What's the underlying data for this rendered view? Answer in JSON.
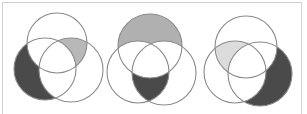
{
  "figure": {
    "colors": {
      "dark": "#4a4a4a",
      "medium": "#b4b4b4",
      "light": "#dcdcdc",
      "outline": "#8a8a8a",
      "frame": "#cfcfcf"
    },
    "diagrams": [
      {
        "id": "venn-1",
        "circles": {
          "top": {
            "cx": 57,
            "cy": 43,
            "r": 30
          },
          "left": {
            "cx": 45,
            "cy": 69,
            "r": 31
          },
          "right": {
            "cx": 71,
            "cy": 70,
            "r": 32
          }
        },
        "shaded": [
          {
            "region": "left only",
            "shade": "dark"
          },
          {
            "region": "top and right, not left",
            "shade": "medium"
          }
        ]
      },
      {
        "id": "venn-2",
        "circles": {
          "top": {
            "cx": 150,
            "cy": 46,
            "r": 32
          },
          "left": {
            "cx": 138,
            "cy": 72,
            "r": 31
          },
          "right": {
            "cx": 164,
            "cy": 73,
            "r": 32
          }
        },
        "shaded": [
          {
            "region": "top only",
            "shade": "medium"
          },
          {
            "region": "left and right, not top",
            "shade": "dark"
          }
        ]
      },
      {
        "id": "venn-3",
        "circles": {
          "top": {
            "cx": 246,
            "cy": 47,
            "r": 31
          },
          "left": {
            "cx": 235,
            "cy": 72,
            "r": 31
          },
          "right": {
            "cx": 260,
            "cy": 74,
            "r": 32
          }
        },
        "shaded": [
          {
            "region": "top and left, not right",
            "shade": "light"
          },
          {
            "region": "right only",
            "shade": "dark"
          }
        ]
      }
    ]
  }
}
